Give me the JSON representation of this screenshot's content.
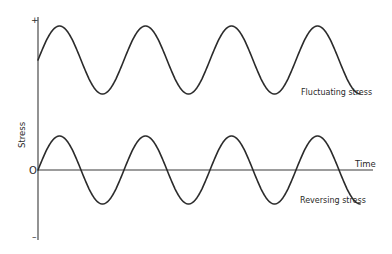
{
  "diagram": {
    "title": "",
    "axes": {
      "y_label": "Stress",
      "x_label": "Time",
      "y_plus": "+",
      "y_zero": "O",
      "y_minus": "–"
    },
    "waves": [
      {
        "id": "fluctuating",
        "label": "Fluctuating stress",
        "mean": 0.5,
        "amplitude": 0.5,
        "cycles": 3.75,
        "phase": "starts at mean, rising"
      },
      {
        "id": "reversing",
        "label": "Reversing stress",
        "mean": 0,
        "amplitude": 0.5,
        "cycles": 3.75,
        "phase": "starts at zero, rising"
      }
    ]
  }
}
